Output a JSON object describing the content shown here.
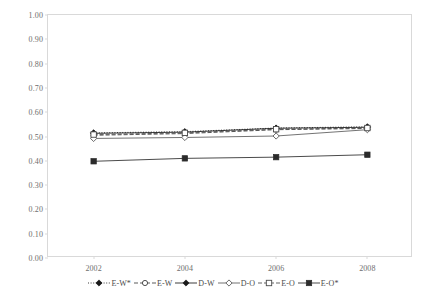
{
  "title_fragment": "…",
  "chart_data": {
    "type": "line",
    "title": "",
    "subtitle": "",
    "xlabel": "",
    "ylabel": "",
    "x": [
      2002,
      2004,
      2006,
      2008
    ],
    "categories": [
      "2002",
      "2004",
      "2006",
      "2008"
    ],
    "xtick_labels": [
      "2002",
      "2004",
      "2006",
      "2008"
    ],
    "ytick_labels": [
      "0.00",
      "0.10",
      "0.20",
      "0.30",
      "0.40",
      "0.50",
      "0.60",
      "0.70",
      "0.80",
      "0.90",
      "1.00"
    ],
    "ytick_values": [
      0.0,
      0.1,
      0.2,
      0.3,
      0.4,
      0.5,
      0.6,
      0.7,
      0.8,
      0.9,
      1.0
    ],
    "ylim": [
      0.0,
      1.0
    ],
    "xlim": [
      2001,
      2009
    ],
    "grid": false,
    "legend_position": "bottom-center",
    "series": [
      {
        "name": "E-W*",
        "marker": "filled-diamond",
        "line_style": "dotted",
        "color": "#1a1a1a",
        "values": [
          0.515,
          0.52,
          0.535,
          0.54
        ]
      },
      {
        "name": "E-W",
        "marker": "open-circle",
        "line_style": "dashed",
        "color": "#3d3d3d",
        "values": [
          0.505,
          0.512,
          0.528,
          0.533
        ]
      },
      {
        "name": "D-W",
        "marker": "filled-diamond",
        "line_style": "solid",
        "color": "#1a1a1a",
        "values": [
          0.513,
          0.518,
          0.534,
          0.538
        ]
      },
      {
        "name": "D-O",
        "marker": "open-diamond",
        "line_style": "solid",
        "color": "#5a5a5a",
        "values": [
          0.492,
          0.496,
          0.502,
          0.528
        ]
      },
      {
        "name": "E-O",
        "marker": "open-square",
        "line_style": "dashed",
        "color": "#4a4a4a",
        "values": [
          0.508,
          0.515,
          0.53,
          0.535
        ]
      },
      {
        "name": "E-O*",
        "marker": "filled-square",
        "line_style": "solid",
        "color": "#2b2b2b",
        "values": [
          0.398,
          0.41,
          0.415,
          0.425
        ]
      }
    ]
  }
}
